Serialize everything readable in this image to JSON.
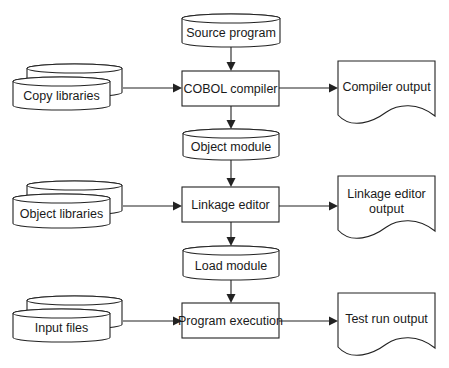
{
  "diagram": {
    "colors": {
      "line": "#222222",
      "fill": "#ffffff",
      "text": "#1a1a1a",
      "background": "#ffffff"
    },
    "nodes": [
      {
        "id": "source_program",
        "type": "cylinder",
        "label": [
          "Source program"
        ],
        "x": 182,
        "y": 14,
        "w": 98,
        "h": 33
      },
      {
        "id": "copy_libraries",
        "type": "stacked-cylinder",
        "label": [
          "Copy libraries"
        ],
        "x": 13,
        "y": 64,
        "w": 97,
        "h": 46,
        "offset": 13
      },
      {
        "id": "cobol_compiler",
        "type": "process",
        "label": [
          "COBOL compiler"
        ],
        "x": 182,
        "y": 71,
        "w": 97,
        "h": 35
      },
      {
        "id": "compiler_output",
        "type": "document",
        "label": [
          "Compiler output"
        ],
        "x": 338,
        "y": 61,
        "w": 97,
        "h": 62
      },
      {
        "id": "object_module",
        "type": "cylinder",
        "label": [
          "Object module"
        ],
        "x": 183,
        "y": 129,
        "w": 96,
        "h": 31
      },
      {
        "id": "object_libraries",
        "type": "stacked-cylinder",
        "label": [
          "Object libraries"
        ],
        "x": 13,
        "y": 181,
        "w": 97,
        "h": 47,
        "offset": 13
      },
      {
        "id": "linkage_editor",
        "type": "process",
        "label": [
          "Linkage editor"
        ],
        "x": 182,
        "y": 187,
        "w": 97,
        "h": 35
      },
      {
        "id": "linkage_editor_output",
        "type": "document",
        "label": [
          "Linkage editor",
          "output"
        ],
        "x": 338,
        "y": 176,
        "w": 97,
        "h": 62
      },
      {
        "id": "load_module",
        "type": "cylinder",
        "label": [
          "Load module"
        ],
        "x": 183,
        "y": 246,
        "w": 96,
        "h": 34
      },
      {
        "id": "input_files",
        "type": "stacked-cylinder",
        "label": [
          "Input files"
        ],
        "x": 13,
        "y": 296,
        "w": 97,
        "h": 46,
        "offset": 13
      },
      {
        "id": "program_execution",
        "type": "process",
        "label": [
          "Program execution"
        ],
        "x": 182,
        "y": 303,
        "w": 97,
        "h": 35
      },
      {
        "id": "test_run_output",
        "type": "document",
        "label": [
          "Test run output"
        ],
        "x": 338,
        "y": 293,
        "w": 97,
        "h": 62
      }
    ],
    "edges": [
      {
        "from": "source_program",
        "to": "cobol_compiler",
        "points": [
          [
            231,
            47
          ],
          [
            231,
            71
          ]
        ]
      },
      {
        "from": "copy_libraries",
        "to": "cobol_compiler",
        "points": [
          [
            123,
            88
          ],
          [
            182,
            88
          ]
        ]
      },
      {
        "from": "cobol_compiler",
        "to": "compiler_output",
        "points": [
          [
            279,
            88
          ],
          [
            338,
            88
          ]
        ]
      },
      {
        "from": "cobol_compiler",
        "to": "object_module",
        "points": [
          [
            231,
            106
          ],
          [
            231,
            129
          ]
        ]
      },
      {
        "from": "object_module",
        "to": "linkage_editor",
        "points": [
          [
            231,
            160
          ],
          [
            231,
            187
          ]
        ]
      },
      {
        "from": "object_libraries",
        "to": "linkage_editor",
        "points": [
          [
            123,
            206
          ],
          [
            182,
            206
          ]
        ]
      },
      {
        "from": "linkage_editor",
        "to": "linkage_editor_output",
        "points": [
          [
            279,
            206
          ],
          [
            338,
            206
          ]
        ]
      },
      {
        "from": "linkage_editor",
        "to": "load_module",
        "points": [
          [
            231,
            222
          ],
          [
            231,
            246
          ]
        ]
      },
      {
        "from": "load_module",
        "to": "program_execution",
        "points": [
          [
            231,
            280
          ],
          [
            231,
            303
          ]
        ]
      },
      {
        "from": "input_files",
        "to": "program_execution",
        "points": [
          [
            123,
            321
          ],
          [
            182,
            321
          ]
        ]
      },
      {
        "from": "program_execution",
        "to": "test_run_output",
        "points": [
          [
            279,
            321
          ],
          [
            338,
            321
          ]
        ]
      }
    ]
  }
}
